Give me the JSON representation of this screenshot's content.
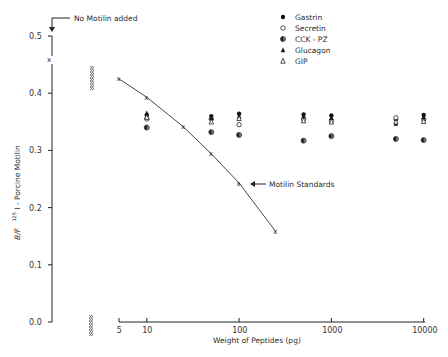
{
  "chart_data": {
    "type": "scatter",
    "title": "",
    "xlabel": "Weight of Peptides (pg)",
    "ylabel": "B/F ¹²⁵I - Porcine Motilin",
    "xscale": "log",
    "xlim": [
      5,
      10000
    ],
    "ylim": [
      0.0,
      0.5
    ],
    "x_ticks": [
      "5",
      "10",
      "100",
      "1000",
      "10000"
    ],
    "y_ticks": [
      "0.0",
      "0.1",
      "0.2",
      "0.3",
      "0.4",
      "0.5"
    ],
    "grid": false,
    "legend_position": "top-right",
    "annotations": [
      {
        "text": "No Motilin added",
        "target": "zero-dose point",
        "value": 0.46
      },
      {
        "text": "Motilin Standards",
        "target": "standard curve at 100 pg"
      }
    ],
    "series": [
      {
        "name": "Motilin Standards",
        "marker": "x",
        "line": true,
        "x": [
          5,
          10,
          25,
          50,
          100,
          250
        ],
        "values": [
          0.425,
          0.393,
          0.341,
          0.294,
          0.243,
          0.158
        ]
      },
      {
        "name": "Gastrin",
        "marker": "filled-circle",
        "x": [
          10,
          50,
          100,
          500,
          1000,
          5000,
          10000
        ],
        "values": [
          0.362,
          0.36,
          0.364,
          0.363,
          0.361,
          0.354,
          0.362
        ]
      },
      {
        "name": "Secretin",
        "marker": "open-circle",
        "x": [
          10,
          50,
          100,
          500,
          1000,
          5000,
          10000
        ],
        "values": [
          0.355,
          0.355,
          0.345,
          0.355,
          0.352,
          0.357,
          0.354
        ]
      },
      {
        "name": "CCK - PZ",
        "marker": "half-filled-circle",
        "x": [
          10,
          50,
          100,
          500,
          1000,
          5000,
          10000
        ],
        "values": [
          0.34,
          0.332,
          0.327,
          0.317,
          0.325,
          0.32,
          0.318
        ]
      },
      {
        "name": "Glucagon",
        "marker": "filled-triangle",
        "x": [
          10,
          50,
          100,
          500,
          1000,
          5000,
          10000
        ],
        "values": [
          0.365,
          0.357,
          0.36,
          0.36,
          0.357,
          0.347,
          0.358
        ]
      },
      {
        "name": "GIP",
        "marker": "open-triangle",
        "x": [
          10,
          50,
          100,
          500,
          1000,
          5000,
          10000
        ],
        "values": [
          0.358,
          0.35,
          0.356,
          0.352,
          0.35,
          0.35,
          0.351
        ]
      }
    ],
    "no_motilin_point": 0.46
  },
  "labels": {
    "no_motilin": "No Motilin added",
    "standards": "Motilin Standards",
    "xlabel": "Weight of Peptides (pg)",
    "ylabel_prefix": "B/F",
    "ylabel_sup": "125",
    "ylabel_rest": "I - Porcine Motilin"
  },
  "legend": [
    {
      "label": "Gastrin",
      "marker": "filled-circle"
    },
    {
      "label": "Secretin",
      "marker": "open-circle"
    },
    {
      "label": "CCK - PZ",
      "marker": "half-filled-circle"
    },
    {
      "label": "Glucagon",
      "marker": "filled-triangle"
    },
    {
      "label": "GIP",
      "marker": "open-triangle"
    }
  ],
  "axis": {
    "y_ticks": [
      "0.0",
      "0.1",
      "0.2",
      "0.3",
      "0.4",
      "0.5"
    ],
    "x_ticks": [
      "5",
      "10",
      "100",
      "1000",
      "10000"
    ]
  },
  "colors": {
    "ink": "#1a1a1a",
    "background": "#ffffff"
  }
}
